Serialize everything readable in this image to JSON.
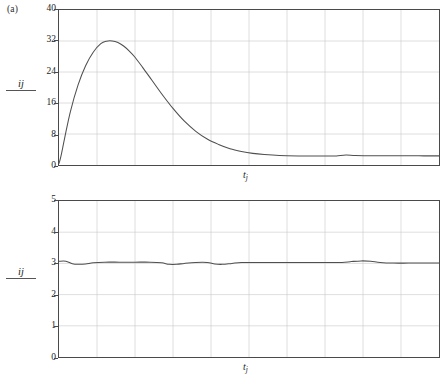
{
  "figure": {
    "panel_tag": "(a)",
    "background": "#ffffff",
    "axis_color": "#4a4a4a",
    "grid_color": "#c9c9c9",
    "curve_color": "#4f4f4f"
  },
  "labels": {
    "y_numerator": "i",
    "y_subscript": "j",
    "x_symbol": "t",
    "x_subscript": "j"
  },
  "chart_data": [
    {
      "type": "line",
      "id": "panel-a-top",
      "title": "",
      "xlabel": "t_j",
      "ylabel": "i_j",
      "xlim": [
        0,
        10
      ],
      "ylim": [
        0,
        40
      ],
      "yticks": [
        0,
        8,
        16,
        24,
        32,
        40
      ],
      "ytick_labels": [
        "0",
        "8",
        "16",
        "24",
        "32",
        "40"
      ],
      "xticks": [
        0,
        1,
        2,
        3,
        4,
        5,
        6,
        7,
        8,
        9,
        10
      ],
      "xtick_labels": [],
      "grid": true,
      "legend": "none",
      "series": [
        {
          "name": "i_j",
          "x": [
            0.0,
            0.05,
            0.15,
            0.3,
            0.5,
            0.7,
            0.9,
            1.1,
            1.25,
            1.4,
            1.55,
            1.7,
            1.85,
            2.0,
            2.2,
            2.45,
            2.7,
            3.0,
            3.3,
            3.6,
            3.9,
            4.2,
            4.5,
            4.8,
            5.1,
            5.4,
            5.8,
            6.3,
            6.8,
            7.1,
            7.3,
            7.55,
            7.8,
            8.2,
            8.7,
            9.2,
            9.6,
            10.0
          ],
          "y": [
            0.4,
            2.2,
            7.0,
            13.8,
            20.6,
            25.6,
            29.1,
            31.3,
            31.95,
            32.0,
            31.6,
            30.7,
            29.4,
            27.8,
            25.2,
            21.8,
            18.4,
            14.6,
            11.3,
            8.7,
            6.7,
            5.3,
            4.2,
            3.5,
            3.0,
            2.7,
            2.45,
            2.35,
            2.33,
            2.33,
            2.33,
            2.6,
            2.45,
            2.4,
            2.38,
            2.37,
            2.36,
            2.36
          ]
        }
      ],
      "annotations": {
        "peak_value": 32.0,
        "peak_x_approx": 1.4,
        "start_value": 0.0,
        "asymptote_value": 2.35
      }
    },
    {
      "type": "line",
      "id": "panel-a-bottom",
      "title": "",
      "xlabel": "t_j",
      "ylabel": "i_j",
      "xlim": [
        0,
        10
      ],
      "ylim": [
        0,
        5
      ],
      "yticks": [
        0,
        1,
        2,
        3,
        4,
        5
      ],
      "ytick_labels": [
        "0",
        "1",
        "2",
        "3",
        "4",
        "5"
      ],
      "xticks": [
        0,
        1,
        2,
        3,
        4,
        5,
        6,
        7,
        8,
        9,
        10
      ],
      "xtick_labels": [],
      "grid": true,
      "legend": "none",
      "series": [
        {
          "name": "i_j",
          "x": [
            0.0,
            0.18,
            0.35,
            0.5,
            0.7,
            0.9,
            1.2,
            1.6,
            2.0,
            2.4,
            2.7,
            2.9,
            3.1,
            3.3,
            3.6,
            3.9,
            4.1,
            4.3,
            4.55,
            4.8,
            5.2,
            5.7,
            6.2,
            6.7,
            7.1,
            7.45,
            7.7,
            7.95,
            8.2,
            8.45,
            8.8,
            9.2,
            9.6,
            10.0
          ],
          "y": [
            3.07,
            3.07,
            2.99,
            2.97,
            2.98,
            3.02,
            3.04,
            3.04,
            3.04,
            3.04,
            3.02,
            2.97,
            2.97,
            3.0,
            3.03,
            3.03,
            2.98,
            2.97,
            3.0,
            3.03,
            3.03,
            3.03,
            3.03,
            3.03,
            3.03,
            3.03,
            3.06,
            3.08,
            3.07,
            3.03,
            3.01,
            3.01,
            3.01,
            3.01
          ]
        }
      ],
      "annotations": {
        "steady_value": 3.0
      }
    }
  ]
}
